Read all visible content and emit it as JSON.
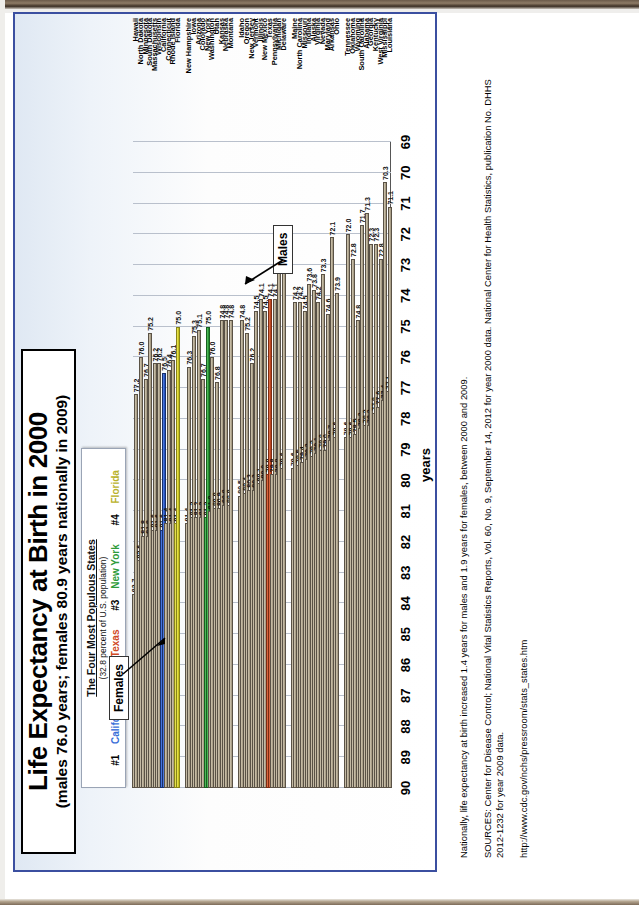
{
  "chart_data": {
    "type": "bar",
    "orientation": "horizontal",
    "title": "Life Expectancy at Birth in 2000",
    "subtitle": "(males 76.0 years; females 80.9 years nationally in 2009)",
    "xlabel": "",
    "ylabel": "years",
    "axis_range": [
      69,
      90
    ],
    "axis_ticks": [
      90,
      89,
      88,
      87,
      86,
      85,
      84,
      83,
      82,
      81,
      80,
      79,
      78,
      77,
      76,
      75,
      74,
      73,
      72,
      71,
      70,
      69
    ],
    "grid": true,
    "series_names": [
      "Females",
      "Males"
    ],
    "categories": [
      "Hawaii",
      "North Dakota",
      "Minnesota",
      "South Dakota",
      "Massachusetts",
      "Wisconsin",
      "California",
      "Connecticut",
      "Rhode Island",
      "Florida",
      "New Hampshire",
      "Iowa",
      "Arizona",
      "Colorado",
      "New York",
      "Washington",
      "Utah",
      "Kansas",
      "Nebraska",
      "Montana",
      "Idaho",
      "Oregon",
      "New Jersey",
      "Vermont",
      "Illinois",
      "New Mexico",
      "Texas",
      "Pennsylvania",
      "Michigan",
      "Delaware",
      "Maine",
      "North Carolina",
      "Missouri",
      "Indiana",
      "Alaska",
      "Virginia",
      "Nevada",
      "Maryland",
      "Arkansas",
      "Ohio",
      "Tennessee",
      "Oklahoma",
      "Wyoming",
      "South Carolina",
      "Alabama",
      "Georgia",
      "Kentucky",
      "West Virginia",
      "Mississippi",
      "Louisiana"
    ],
    "series": [
      {
        "name": "Females",
        "values": [
          83.7,
          82.6,
          81.8,
          81.8,
          81.6,
          81.6,
          81.6,
          81.4,
          81.4,
          81.4,
          81.4,
          81.2,
          81.2,
          81.2,
          81.2,
          81.0,
          80.9,
          80.9,
          80.8,
          80.8,
          80.5,
          80.4,
          80.3,
          80.3,
          80.1,
          80.0,
          79.8,
          79.8,
          79.8,
          79.6,
          79.6,
          79.5,
          79.4,
          79.3,
          79.2,
          79.1,
          79.0,
          79.0,
          78.7,
          78.6,
          78.6,
          78.6,
          78.5,
          78.3,
          78.2,
          78.2,
          77.8,
          77.6,
          77.4,
          77.1
        ]
      },
      {
        "name": "Males",
        "values": [
          77.2,
          76.0,
          76.7,
          75.2,
          76.2,
          76.2,
          76.5,
          76.4,
          76.1,
          75.0,
          76.3,
          75.3,
          75.1,
          76.7,
          75.0,
          76.0,
          76.8,
          74.8,
          74.8,
          74.8,
          74.8,
          75.2,
          76.2,
          74.5,
          74.1,
          74.5,
          74.1,
          74.1,
          73.1,
          73.2,
          74.2,
          74.2,
          74.5,
          73.6,
          73.8,
          74.2,
          73.3,
          74.6,
          72.1,
          73.9,
          72.0,
          72.8,
          74.8,
          71.7,
          71.3,
          72.3,
          72.3,
          72.8,
          70.3,
          71.1
        ]
      }
    ],
    "highlight": {
      "note": "The four most populous states are color-coded",
      "California": "#2f5fd0",
      "Texas": "#cf4f26",
      "New York": "#2fa13a",
      "Florida": "#d9d326"
    },
    "annotations": [
      "Females",
      "Males"
    ]
  },
  "legend": {
    "heading": "The Four Most Populous States",
    "subheading": "(32.8 percent of U.S. population)",
    "entries": [
      {
        "rank": "#1",
        "state": "California",
        "color": "#3a6fd8"
      },
      {
        "rank": "#2",
        "state": "Texas",
        "color": "#d04a24"
      },
      {
        "rank": "#3",
        "state": "New York",
        "color": "#2f9c3a"
      },
      {
        "rank": "#4",
        "state": "Florida",
        "color": "#b9b22a"
      }
    ]
  },
  "callouts": {
    "females": "Females",
    "males": "Males"
  },
  "notes": [
    "Nationally, life expectancy at birth increased 1.4 years for males and 1.9 years for females, between 2000 and 2009.",
    "SOURCES: Center for Disease Control; National Vital Statistics Reports, Vol. 60, No. 9, September 14, 2012 for year 2000 data.  National Center for Health Statistics, publication No. DHHS 2012-1232 for year 2009 data.",
    "http://www.cdc.gov/nchs/pressroom/stats_states.htm"
  ]
}
